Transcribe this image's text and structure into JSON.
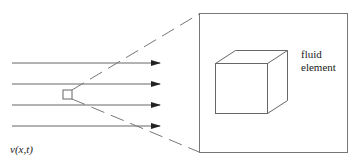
{
  "diagram": {
    "velocity_label": "v(x,t)",
    "element_label_line1": "fluid",
    "element_label_line2": "element",
    "colors": {
      "stroke": "#555555",
      "background": "#ffffff"
    },
    "streamlines": 4
  }
}
